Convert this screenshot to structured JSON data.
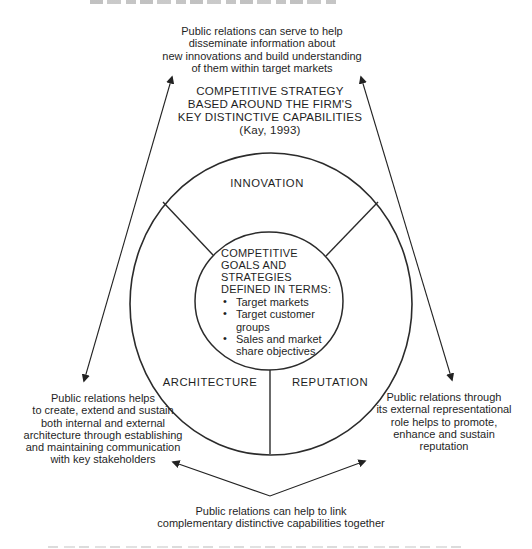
{
  "title": "COMPETITIVE STRATEGY\nBASED AROUND THE FIRM'S\nKEY DISTINCTIVE CAPABILITIES\n(Kay, 1993)",
  "notes": {
    "top": "Public relations can serve to help\ndisseminate information about\nnew innovations and build understanding\nof them within target markets",
    "left": "Public relations helps\nto create, extend and sustain\nboth internal and external\narchitecture through establishing\nand maintaining communication\nwith key stakeholders",
    "right": "Public relations through\nits external representational\nrole helps to promote,\nenhance and sustain\nreputation",
    "bottom": "Public relations can help to link\ncomplementary distinctive capabilities together"
  },
  "segments": {
    "top": "INNOVATION",
    "bottom_left": "ARCHITECTURE",
    "bottom_right": "REPUTATION"
  },
  "center": {
    "heading": "COMPETITIVE\nGOALS AND\nSTRATEGIES\nDEFINED IN TERMS:",
    "bullets": [
      "Target markets",
      "Target customer\ngroups",
      "Sales and market\nshare objectives"
    ]
  },
  "colors": {
    "ink": "#1f1f1f",
    "line": "#2b2b2b",
    "background": "#ffffff"
  }
}
